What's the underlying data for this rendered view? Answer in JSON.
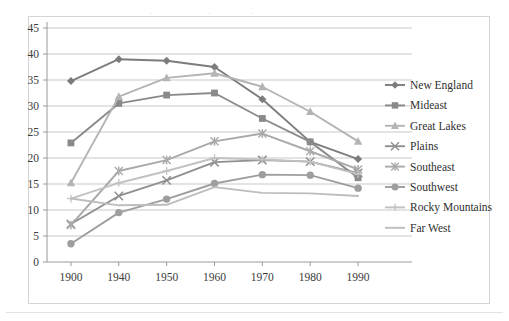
{
  "chart_data": {
    "type": "line",
    "title": "",
    "subtitle": "",
    "xlabel": "",
    "ylabel": "",
    "categories": [
      "1900",
      "1940",
      "1950",
      "1960",
      "1970",
      "1980",
      "1990"
    ],
    "ylim": [
      0,
      45
    ],
    "ytick_step": 5,
    "yticks": [
      "0",
      "5",
      "10",
      "15",
      "20",
      "25",
      "30",
      "35",
      "40",
      "45"
    ],
    "grid": "horizontal",
    "legend_position": "right",
    "series": [
      {
        "name": "New England",
        "marker": "diamond",
        "color": "#7c7c7c",
        "values": [
          34.8,
          39.0,
          38.7,
          37.5,
          31.3,
          23.1,
          19.8
        ]
      },
      {
        "name": "Mideast",
        "marker": "square",
        "color": "#8a8a8a",
        "values": [
          22.9,
          30.5,
          32.1,
          32.5,
          27.6,
          23.1,
          16.2
        ]
      },
      {
        "name": "Great Lakes",
        "marker": "triangle",
        "color": "#b4b4b4",
        "values": [
          15.2,
          31.8,
          35.4,
          36.3,
          33.7,
          28.9,
          23.2
        ]
      },
      {
        "name": "Plains",
        "marker": "cross",
        "color": "#8f8f8f",
        "values": [
          7.3,
          12.7,
          15.7,
          19.2,
          19.6,
          19.3,
          17.1
        ]
      },
      {
        "name": "Southeast",
        "marker": "star",
        "color": "#a9a9a9",
        "values": [
          7.1,
          17.5,
          19.6,
          23.2,
          24.7,
          21.3,
          17.8
        ]
      },
      {
        "name": "Southwest",
        "marker": "circle",
        "color": "#9e9e9e",
        "values": [
          3.5,
          9.5,
          12.1,
          15.1,
          16.8,
          16.7,
          14.2
        ]
      },
      {
        "name": "Rocky Mountains",
        "marker": "plus",
        "color": "#c2c2c2",
        "values": [
          12.2,
          15.2,
          17.5,
          20.0,
          19.7,
          19.3,
          16.9
        ]
      },
      {
        "name": "Far West",
        "marker": "none",
        "color": "#bdbdbd",
        "values": [
          12.2,
          10.9,
          11.0,
          14.4,
          13.3,
          13.2,
          12.7
        ]
      }
    ]
  },
  "crop_artifacts": {
    "a": "·",
    "b": "·",
    "c": "·"
  }
}
